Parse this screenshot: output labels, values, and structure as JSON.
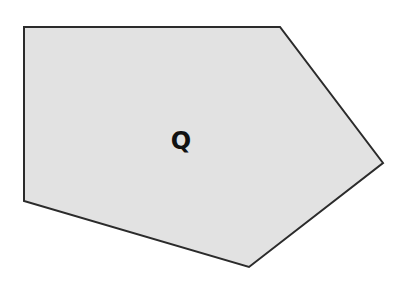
{
  "figure": {
    "shape": "pentagon",
    "label": "Q",
    "fill_color": "#e2e2e2",
    "stroke_color": "#2b2b2b",
    "vertices": [
      [
        24,
        27
      ],
      [
        280,
        27
      ],
      [
        383,
        163
      ],
      [
        249,
        267
      ],
      [
        24,
        201
      ]
    ]
  }
}
